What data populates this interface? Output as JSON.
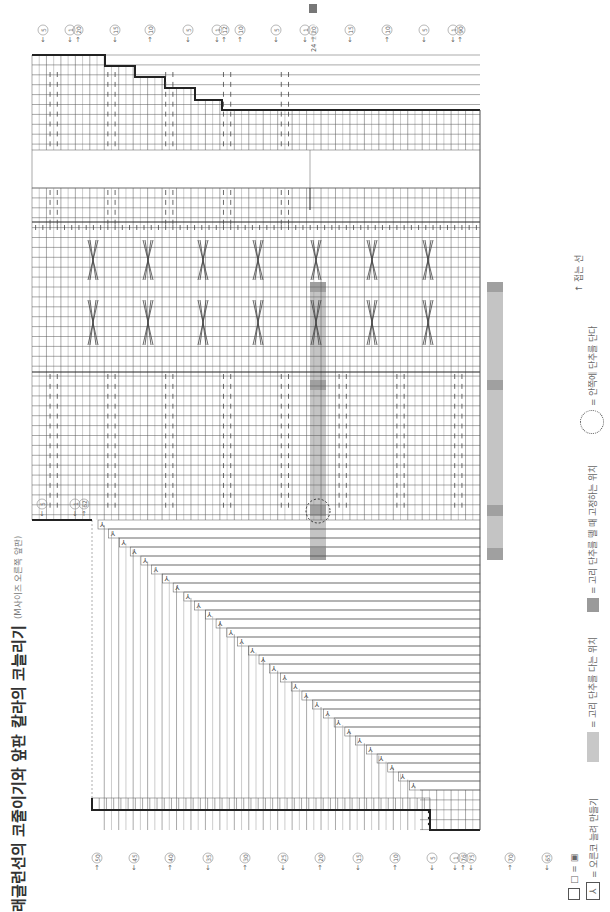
{
  "title": {
    "main": "래글런선의 코줄이기와 앞판 칼라의 코늘리기",
    "sub": "(M사이즈 오른쪽 앞판)"
  },
  "fold_line": {
    "label": "접는 선",
    "arrow": "↑"
  },
  "legend": {
    "items": [
      {
        "swatch": "box-equal",
        "label": "□ = ▣"
      },
      {
        "swatch": "increase",
        "label": "= 오른코 늘려 만들기"
      },
      {
        "swatch": "light",
        "label": "= 고리 단추를 다는 위치"
      },
      {
        "swatch": "dark",
        "label": "= 고리 단추를 뗄 때 고정하는 위치"
      },
      {
        "swatch": "circle",
        "label": "= 안쪽에 단추를 단다"
      }
    ]
  },
  "colors": {
    "grid": "#555555",
    "grid_light": "#9a9a9a",
    "bold": "#222222",
    "shade_light": "#c4c4c4",
    "shade_dark": "#a0a0a0",
    "label": "#666666"
  },
  "grid": {
    "x0": 32,
    "x1": 480,
    "cols": 62,
    "row_h": 9.9,
    "sections": {
      "top_band_y": [
        55,
        150
      ],
      "gap_y": [
        150,
        188
      ],
      "rib_y": [
        188,
        222
      ],
      "cable_y": [
        222,
        372
      ],
      "body_y": [
        372,
        520
      ],
      "raglan_y": [
        520,
        790
      ],
      "bottom_band_y": [
        790,
        830
      ]
    }
  },
  "top_labels": [
    {
      "text": "5",
      "x": 43,
      "dir": "down"
    },
    {
      "text": "1",
      "x": 70,
      "dir": "down"
    },
    {
      "text": "20",
      "x": 78,
      "dir": "up"
    },
    {
      "text": "15",
      "x": 115,
      "dir": "down"
    },
    {
      "text": "10",
      "x": 150,
      "dir": "up"
    },
    {
      "text": "5",
      "x": 188,
      "dir": "down"
    },
    {
      "text": "1",
      "x": 217,
      "dir": "down"
    },
    {
      "text": "12",
      "x": 224,
      "dir": "up"
    },
    {
      "text": "10",
      "x": 240,
      "dir": "up"
    },
    {
      "text": "5",
      "x": 276,
      "dir": "down"
    },
    {
      "text": "1",
      "x": 305,
      "dir": "down"
    },
    {
      "text": "20",
      "x": 313,
      "dir": "up"
    },
    {
      "text": "15",
      "x": 350,
      "dir": "down"
    },
    {
      "text": "10",
      "x": 387,
      "dir": "up"
    },
    {
      "text": "5",
      "x": 424,
      "dir": "down"
    },
    {
      "text": "1",
      "x": 453,
      "dir": "down"
    },
    {
      "text": "90",
      "x": 460,
      "dir": "up"
    },
    {
      "text": "85",
      "x": 496,
      "dir": "down"
    },
    {
      "text": "80",
      "x": 533,
      "dir": "up"
    }
  ],
  "size_variants": {
    "x": 313,
    "values": [
      "16",
      "20",
      "24"
    ],
    "highlight": "16"
  },
  "left_labels": [
    {
      "text": "5",
      "y": 488,
      "dir": "down"
    },
    {
      "text": "1",
      "y": 488,
      "x": 78,
      "dir": "down"
    },
    {
      "text": "62",
      "y": 488,
      "x": 86,
      "dir": "up"
    }
  ],
  "bottom_labels": [
    {
      "text": "50",
      "x": 97,
      "dir": "up"
    },
    {
      "text": "45",
      "x": 134,
      "dir": "down"
    },
    {
      "text": "40",
      "x": 170,
      "dir": "up"
    },
    {
      "text": "35",
      "x": 208,
      "dir": "down"
    },
    {
      "text": "30",
      "x": 245,
      "dir": "up"
    },
    {
      "text": "25",
      "x": 283,
      "dir": "down"
    },
    {
      "text": "20",
      "x": 320,
      "dir": "up"
    },
    {
      "text": "15",
      "x": 358,
      "dir": "down"
    },
    {
      "text": "10",
      "x": 395,
      "dir": "up"
    },
    {
      "text": "5",
      "x": 432,
      "dir": "down"
    },
    {
      "text": "1",
      "x": 455,
      "dir": "down"
    },
    {
      "text": "76",
      "x": 463,
      "dir": "up"
    },
    {
      "text": "75",
      "x": 471,
      "dir": "down"
    },
    {
      "text": "70",
      "x": 510,
      "dir": "up"
    },
    {
      "text": "65",
      "x": 547,
      "dir": "down"
    }
  ],
  "shaded_columns": [
    {
      "x": 310,
      "w": 16,
      "y0": 282,
      "y1": 560,
      "dark_rows": [
        [
          282,
          292
        ],
        [
          380,
          390
        ],
        [
          505,
          516
        ],
        [
          548,
          560
        ]
      ]
    },
    {
      "x": 487,
      "w": 16,
      "y0": 282,
      "y1": 560,
      "dark_rows": [
        [
          282,
          292
        ],
        [
          380,
          390
        ],
        [
          505,
          516
        ],
        [
          548,
          560
        ]
      ]
    }
  ],
  "button_circle": {
    "cx": 318,
    "cy": 511,
    "r": 12
  }
}
